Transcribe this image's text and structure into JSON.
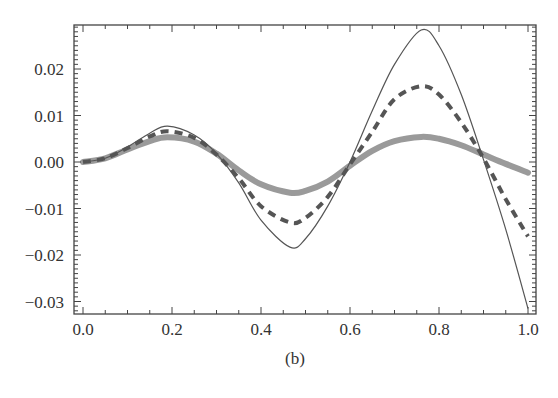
{
  "caption": "(b)",
  "chart_data": {
    "type": "line",
    "title": "",
    "caption": "(b)",
    "xlabel": "",
    "ylabel": "",
    "xlim": [
      0.0,
      1.0
    ],
    "ylim": [
      -0.0325,
      0.0295
    ],
    "grid": false,
    "legend": null,
    "x_ticks": [
      0.0,
      0.2,
      0.4,
      0.6,
      0.8,
      1.0
    ],
    "x_tick_labels": [
      "0.0",
      "0.2",
      "0.4",
      "0.6",
      "0.8",
      "1.0"
    ],
    "y_ticks": [
      0.02,
      0.01,
      0.0,
      -0.01,
      -0.02,
      -0.03
    ],
    "y_tick_labels": [
      "0.02",
      "0.01",
      "0.00",
      "−0.01",
      "−0.02",
      "−0.03"
    ],
    "x": [
      0.0,
      0.05,
      0.1,
      0.15,
      0.19,
      0.25,
      0.3,
      0.35,
      0.4,
      0.465,
      0.5,
      0.55,
      0.6,
      0.65,
      0.7,
      0.76,
      0.8,
      0.85,
      0.9,
      0.95,
      1.0
    ],
    "series": [
      {
        "name": "thin-solid",
        "style": "solid-thin",
        "color": "#555555",
        "values": [
          0.0,
          0.0008,
          0.0032,
          0.0062,
          0.0077,
          0.0058,
          0.0018,
          -0.0045,
          -0.0125,
          -0.0183,
          -0.0165,
          -0.0095,
          0.0,
          0.011,
          0.021,
          0.0284,
          0.025,
          0.0145,
          0.0005,
          -0.0145,
          -0.0315
        ]
      },
      {
        "name": "dashed",
        "style": "dashed-thick",
        "color": "#555555",
        "values": [
          0.0,
          0.0008,
          0.003,
          0.0055,
          0.0066,
          0.0052,
          0.0016,
          -0.0035,
          -0.0095,
          -0.013,
          -0.012,
          -0.0075,
          -0.0005,
          0.0065,
          0.0135,
          0.0163,
          0.0145,
          0.0085,
          0.0008,
          -0.008,
          -0.016
        ]
      },
      {
        "name": "thick-gray",
        "style": "solid-thick",
        "color": "#9a9a9a",
        "values": [
          0.0,
          0.0008,
          0.0027,
          0.0045,
          0.0053,
          0.0044,
          0.0018,
          -0.0018,
          -0.0048,
          -0.0066,
          -0.0062,
          -0.0042,
          -0.0008,
          0.0024,
          0.0045,
          0.0054,
          0.005,
          0.0036,
          0.0016,
          -0.0004,
          -0.0023
        ]
      }
    ]
  }
}
